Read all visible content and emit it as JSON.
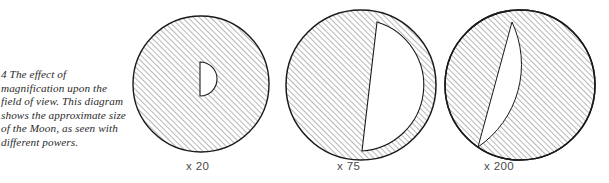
{
  "figure": {
    "caption_number": "4",
    "caption_text": "The effect of magnification upon the field of view. This diagram shows the approximate size of the Moon, as seen with different powers.",
    "caption_full": "4 The effect of magnification upon the field of view. This diagram shows the approximate size of the Moon, as seen with different powers.",
    "ink_color": "#1a1a1a",
    "hatch_color": "#8c8c8c",
    "moon_fill": "#ffffff",
    "background": "#ffffff",
    "panels": [
      {
        "label": "x 20",
        "magnification": 20,
        "field_circle": {
          "cx": 201,
          "cy": 84,
          "r": 68
        },
        "moon": {
          "flat_x": 200,
          "top_y": 62,
          "bottom_y": 96,
          "bulge_x": 222,
          "radius": 17
        }
      },
      {
        "label": "x 75",
        "magnification": 75,
        "field_circle": {
          "cx": 361,
          "cy": 85,
          "r": 75
        },
        "moon": {
          "flat_top_x": 377,
          "flat_top_y": 22,
          "flat_bottom_x": 362,
          "flat_bottom_y": 151,
          "bulge_x": 430,
          "radius": 65
        }
      },
      {
        "label": "x 200",
        "magnification": 200,
        "field_circle": {
          "cx": 520,
          "cy": 85,
          "r": 75
        },
        "moon": {
          "flat_top_x": 512,
          "flat_top_y": 22,
          "flat_bottom_x": 478,
          "flat_bottom_y": 147,
          "bulge_x": 600,
          "radius": 100
        }
      }
    ]
  }
}
